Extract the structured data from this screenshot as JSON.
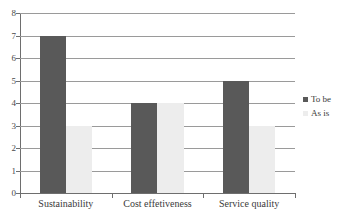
{
  "chart_data": {
    "type": "bar",
    "title": "",
    "subtitle": "",
    "xlabel": "",
    "ylabel": "",
    "categories": [
      "Sustainability",
      "Cost effetiveness",
      "Service quality"
    ],
    "series": [
      {
        "name": "To be",
        "color": "#595959",
        "values": [
          7,
          4,
          5
        ]
      },
      {
        "name": "As is",
        "color": "#ededed",
        "values": [
          3,
          4,
          3
        ]
      }
    ],
    "ylim": [
      0,
      8
    ],
    "y_ticks": [
      0,
      1,
      2,
      3,
      4,
      5,
      6,
      7,
      8
    ],
    "y_tick_labels": [
      "0",
      "1",
      "2",
      "3",
      "4",
      "5",
      "6",
      "7",
      "8"
    ],
    "grid": true,
    "grid_axis": "y",
    "legend_position": "right",
    "legend_entries": [
      "To be",
      "As is"
    ],
    "background_color": "#ffffff",
    "axis_color": "#6e6e6e",
    "gridline_color": "#9a9a9a"
  }
}
